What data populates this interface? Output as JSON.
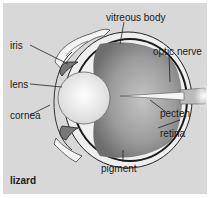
{
  "diagram": {
    "title": "lizard",
    "labels": {
      "vitreous_body": "vitreous body",
      "iris": "iris",
      "optic_nerve": "optic nerve",
      "lens": "lens",
      "pecten": "pecten",
      "cornea": "cornea",
      "retina": "retina",
      "pigment": "pigment"
    },
    "colors": {
      "panel_bg": "#d8d8d8",
      "outer_bg": "#ffffff",
      "vitreous": "#9a9a9a",
      "lens": "#f2f2f2",
      "outline": "#1a1a1a"
    }
  }
}
